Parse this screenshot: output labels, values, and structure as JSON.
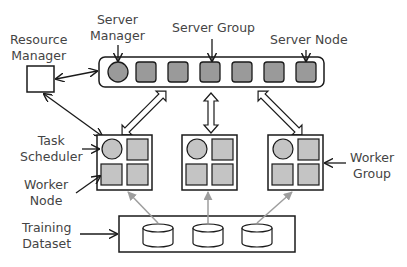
{
  "labels": {
    "resource_manager": [
      "Resource",
      "Manager"
    ],
    "server_manager": [
      "Server",
      "Manager"
    ],
    "server_group": "Server Group",
    "server_node": "Server Node",
    "task_scheduler": [
      "Task",
      "Scheduler"
    ],
    "worker_node": [
      "Worker",
      "Node"
    ],
    "worker_group": [
      "Worker",
      "Group"
    ],
    "training_dataset": [
      "Training",
      "Dataset"
    ]
  },
  "colors": {
    "server_fill": "#9a9a9a",
    "worker_fill": "#c4c4c4",
    "stroke": "#1a1a1a",
    "data_arrow": "#9e9e9e",
    "text": "#444444"
  },
  "counts": {
    "server_nodes": 6,
    "worker_groups": 3,
    "datasets": 3
  }
}
